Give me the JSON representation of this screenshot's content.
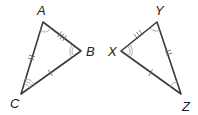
{
  "figure": {
    "stroke_color": "#3a3a3a",
    "mark_color": "#999999"
  },
  "triangle_left": {
    "vertices": {
      "A": {
        "label": "A",
        "x": 43,
        "y": 22
      },
      "B": {
        "label": "B",
        "x": 81,
        "y": 51
      },
      "C": {
        "label": "C",
        "x": 21,
        "y": 94
      }
    },
    "sides": [
      {
        "name": "AB",
        "ticks": 3
      },
      {
        "name": "AC",
        "ticks": 2
      },
      {
        "name": "BC",
        "ticks": 1
      }
    ],
    "angles": [
      {
        "vertex": "A",
        "arcs": 1
      },
      {
        "vertex": "B",
        "arcs": 2
      },
      {
        "vertex": "C",
        "arcs": 3
      }
    ]
  },
  "triangle_right": {
    "vertices": {
      "Y": {
        "label": "Y",
        "x": 157,
        "y": 22
      },
      "X": {
        "label": "X",
        "x": 121,
        "y": 51
      },
      "Z": {
        "label": "Z",
        "x": 181,
        "y": 94
      }
    },
    "sides": [
      {
        "name": "XY",
        "ticks": 3
      },
      {
        "name": "YZ",
        "ticks": 2
      },
      {
        "name": "XZ",
        "ticks": 1
      }
    ],
    "angles": [
      {
        "vertex": "Y",
        "arcs": 1
      },
      {
        "vertex": "X",
        "arcs": 2
      },
      {
        "vertex": "Z",
        "arcs": 3
      }
    ]
  },
  "labels": {
    "A": "A",
    "B": "B",
    "C": "C",
    "X": "X",
    "Y": "Y",
    "Z": "Z"
  }
}
